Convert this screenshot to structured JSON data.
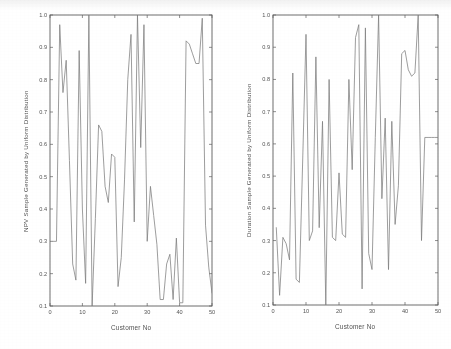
{
  "figure": {
    "background_color": "#ffffff",
    "line_color": "#7a7a7a",
    "axis_color": "#5a5a5a",
    "text_color": "#4a4a4a"
  },
  "chart_data": [
    {
      "type": "line",
      "title": "",
      "xlabel": "Customer No",
      "ylabel": "NPV Sample Generated by Uniform Distribution",
      "xlim": [
        0,
        50
      ],
      "ylim": [
        0.1,
        1.0
      ],
      "xticks": [
        0,
        10,
        20,
        30,
        40,
        50
      ],
      "yticks": [
        0.1,
        0.2,
        0.3,
        0.4,
        0.5,
        0.6,
        0.7,
        0.8,
        0.9,
        1.0
      ],
      "xtick_labels": [
        "0",
        "10",
        "20",
        "30",
        "40",
        "50"
      ],
      "ytick_labels": [
        "0.1",
        "0.2",
        "0.3",
        "0.4",
        "0.5",
        "0.6",
        "0.7",
        "0.8",
        "0.9",
        "1.0"
      ],
      "grid": false,
      "legend": "none",
      "x": [
        1,
        2,
        3,
        4,
        5,
        6,
        7,
        8,
        9,
        10,
        11,
        12,
        13,
        14,
        15,
        16,
        17,
        18,
        19,
        20,
        21,
        22,
        23,
        24,
        25,
        26,
        27,
        28,
        29,
        30,
        31,
        32,
        33,
        34,
        35,
        36,
        37,
        38,
        39,
        40,
        41,
        42,
        43,
        44,
        45,
        46,
        47,
        48,
        49,
        50
      ],
      "values": [
        0.3,
        0.3,
        0.97,
        0.76,
        0.86,
        0.55,
        0.23,
        0.18,
        0.89,
        0.4,
        0.17,
        1.0,
        0.1,
        0.37,
        0.66,
        0.64,
        0.47,
        0.42,
        0.57,
        0.56,
        0.16,
        0.25,
        0.49,
        0.8,
        0.94,
        0.36,
        1.0,
        0.59,
        0.97,
        0.3,
        0.47,
        0.38,
        0.29,
        0.12,
        0.12,
        0.23,
        0.26,
        0.12,
        0.31,
        0.11,
        0.11,
        0.92,
        0.91,
        0.88,
        0.85,
        0.85,
        0.99,
        0.35,
        0.22,
        0.14
      ]
    },
    {
      "type": "line",
      "title": "",
      "xlabel": "Customer No",
      "ylabel": "Duration Sample Generated by Uniform Distribution",
      "xlim": [
        0,
        50
      ],
      "ylim": [
        0.1,
        1.0
      ],
      "xticks": [
        0,
        10,
        20,
        30,
        40,
        50
      ],
      "yticks": [
        0.1,
        0.2,
        0.3,
        0.4,
        0.5,
        0.6,
        0.7,
        0.8,
        0.9,
        1.0
      ],
      "xtick_labels": [
        "0",
        "10",
        "20",
        "30",
        "40",
        "50"
      ],
      "ytick_labels": [
        "0.1",
        "0.2",
        "0.3",
        "0.4",
        "0.5",
        "0.6",
        "0.7",
        "0.8",
        "0.9",
        "1.0"
      ],
      "grid": false,
      "legend": "none",
      "x": [
        1,
        2,
        3,
        4,
        5,
        6,
        7,
        8,
        9,
        10,
        11,
        12,
        13,
        14,
        15,
        16,
        17,
        18,
        19,
        20,
        21,
        22,
        23,
        24,
        25,
        26,
        27,
        28,
        29,
        30,
        31,
        32,
        33,
        34,
        35,
        36,
        37,
        38,
        39,
        40,
        41,
        42,
        43,
        44,
        45,
        46,
        47,
        48,
        49,
        50
      ],
      "values": [
        0.34,
        0.13,
        0.31,
        0.29,
        0.24,
        0.82,
        0.18,
        0.17,
        0.55,
        0.94,
        0.3,
        0.33,
        0.87,
        0.34,
        0.67,
        0.1,
        0.8,
        0.31,
        0.3,
        0.51,
        0.32,
        0.31,
        0.8,
        0.52,
        0.93,
        0.97,
        0.15,
        0.96,
        0.26,
        0.21,
        0.62,
        1.0,
        0.43,
        0.68,
        0.21,
        0.67,
        0.35,
        0.47,
        0.88,
        0.89,
        0.83,
        0.81,
        0.82,
        1.0,
        0.3,
        0.62,
        0.62,
        0.62,
        0.62,
        0.62
      ]
    }
  ]
}
